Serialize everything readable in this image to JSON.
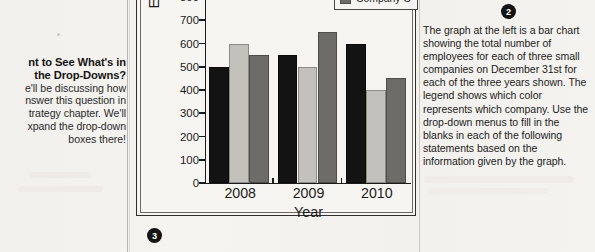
{
  "page": {
    "badges": {
      "chart_badge": "3",
      "instructions_badge": "2"
    }
  },
  "sidebar": {
    "heading_line1": "nt to See What's in",
    "heading_line2": "the Drop-Downs?",
    "body_line1": "e'll be discussing how",
    "body_line2": "nswer this question in",
    "body_line3": "trategy chapter. We'll",
    "body_line4": "xpand the drop-down",
    "body_line5": "boxes there!"
  },
  "instructions": {
    "text": "The graph at the left is a bar chart showing the total number of employees for each of three small companies on December 31st for each of the three years shown. The legend shows which color represents which company. Use the drop-down menus to fill in the blanks in each of the following statements based on the information given by the graph."
  },
  "chart_data": {
    "type": "bar",
    "title": "",
    "xlabel": "Year",
    "ylabel": "Employees",
    "categories": [
      "2008",
      "2009",
      "2010"
    ],
    "series": [
      {
        "name": "Company A",
        "color": "#131313",
        "values": [
          500,
          550,
          600
        ]
      },
      {
        "name": "Company B",
        "color": "#c3c1bc",
        "values": [
          600,
          500,
          400
        ]
      },
      {
        "name": "Company C",
        "color": "#6e6c69",
        "values": [
          550,
          650,
          450
        ]
      }
    ],
    "ylim": [
      0,
      800
    ],
    "ytick_step": 100,
    "yticks": [
      "800",
      "700",
      "600",
      "500",
      "400",
      "300",
      "200",
      "100",
      "0"
    ],
    "grid": false,
    "legend_position": "top-right",
    "legend_visible_entries": [
      "Company B",
      "Company C"
    ]
  }
}
